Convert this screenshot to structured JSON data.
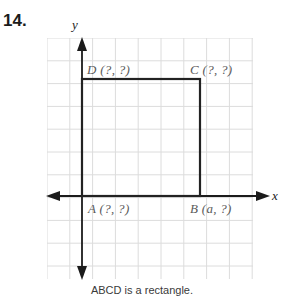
{
  "problem": {
    "number": "14."
  },
  "graph": {
    "axes": {
      "y_label": "y",
      "x_label": "x",
      "x_axis_name": "x-axis",
      "y_axis_name": "y-axis"
    },
    "grid": {
      "cell_size_px": 22.8,
      "columns": 9,
      "rows": 10.6,
      "line_color": "#dcdcdc",
      "visible": true
    },
    "shape": {
      "name": "ABCD",
      "type": "rectangle",
      "stroke_color": "#222222",
      "stroke_width_px": 2.2
    },
    "vertices": [
      {
        "id": "A",
        "label": "A (?, ?)",
        "name": "vertex-label-a",
        "x_px": 82,
        "y_px": 196
      },
      {
        "id": "B",
        "label": "B (a, ?)",
        "name": "vertex-label-b",
        "x_px": 200,
        "y_px": 196
      },
      {
        "id": "C",
        "label": "C (?, ?)",
        "name": "vertex-label-c",
        "x_px": 200,
        "y_px": 79
      },
      {
        "id": "D",
        "label": "D (?, ?)",
        "name": "vertex-label-d",
        "x_px": 82,
        "y_px": 79
      }
    ]
  },
  "caption": {
    "text": "ABCD is a rectangle."
  },
  "colors": {
    "ink": "#222222",
    "label_grey": "#5a5a5a",
    "grid": "#dcdcdc",
    "page": "#ffffff"
  }
}
